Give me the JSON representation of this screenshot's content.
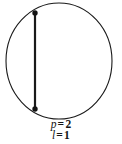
{
  "figure": {
    "type": "geometry-diagram",
    "background_color": "#ffffff",
    "stroke_color": "#1a1a1a",
    "circle": {
      "center_x": 59,
      "center_y": 61,
      "radius_x": 53,
      "radius_y": 58,
      "stroke_width": 1.1
    },
    "chord": {
      "x": 35,
      "y_top": 13,
      "y_bottom": 109,
      "stroke_width": 2.2
    },
    "endpoint_markers": [
      {
        "name": "chord-endpoint-top",
        "x": 35,
        "y": 13,
        "radius": 2.6
      },
      {
        "name": "chord-endpoint-bottom",
        "x": 35,
        "y": 109,
        "radius": 2.6
      }
    ]
  },
  "labels": {
    "line1": {
      "symbol": "p",
      "equals": "=",
      "value": "2",
      "text": "p = 2"
    },
    "line2": {
      "symbol": "l",
      "equals": "=",
      "value": "1",
      "text": "l = 1"
    }
  }
}
